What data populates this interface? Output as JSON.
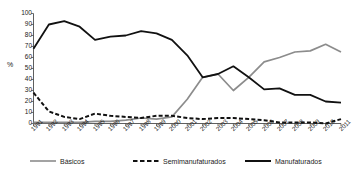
{
  "chart_data": {
    "type": "line",
    "title": "",
    "xlabel": "",
    "ylabel": "%",
    "ylim": [
      0,
      100
    ],
    "yticks": [
      0,
      10,
      20,
      30,
      40,
      50,
      60,
      70,
      80,
      90,
      100
    ],
    "grid": false,
    "legend_position": "bottom",
    "categories": [
      "1991",
      "1992",
      "1993",
      "1994",
      "1995",
      "1996",
      "1997",
      "1998",
      "1999",
      "2000",
      "2001",
      "2002",
      "2003",
      "2004",
      "2005",
      "2006",
      "2007",
      "2008",
      "2009",
      "2010",
      "2011"
    ],
    "series": [
      {
        "name": "Básicos",
        "color": "#8c8c8c",
        "style": "solid",
        "values": [
          1,
          1,
          1,
          1,
          2,
          2,
          3,
          5,
          4,
          6,
          22,
          42,
          45,
          30,
          42,
          56,
          60,
          65,
          66,
          72,
          65
        ]
      },
      {
        "name": "Semimanufaturados",
        "color": "#111111",
        "style": "dashed",
        "values": [
          28,
          11,
          6,
          4,
          9,
          7,
          6,
          5,
          7,
          7,
          5,
          4,
          5,
          5,
          4,
          3,
          1,
          1,
          1,
          0,
          4
        ]
      },
      {
        "name": "Manufaturados",
        "color": "#111111",
        "style": "solid",
        "values": [
          68,
          90,
          93,
          88,
          76,
          79,
          80,
          84,
          82,
          76,
          62,
          42,
          45,
          52,
          42,
          31,
          32,
          26,
          26,
          20,
          19
        ]
      }
    ]
  },
  "axis": {
    "y_label": "%",
    "y_ticks": [
      "100",
      "90",
      "80",
      "70",
      "60",
      "50",
      "40",
      "30",
      "20",
      "10",
      "0"
    ],
    "x_ticks": [
      "1991",
      "1992",
      "1993",
      "1994",
      "1995",
      "1996",
      "1997",
      "1998",
      "1999",
      "2000",
      "2001",
      "2002",
      "2003",
      "2004",
      "2005",
      "2006",
      "2007",
      "2008",
      "2009",
      "2010",
      "2011"
    ]
  },
  "legend": {
    "items": [
      {
        "label": "Básicos"
      },
      {
        "label": "Semimanufaturados"
      },
      {
        "label": "Manufaturados"
      }
    ]
  },
  "colors": {
    "basicos": "#8c8c8c",
    "semimanufaturados": "#111111",
    "manufaturados": "#111111",
    "axis": "#4d4d4d",
    "text": "#1a1a1a",
    "background": "#ffffff"
  }
}
